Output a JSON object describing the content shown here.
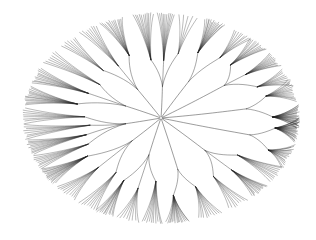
{
  "figure": {
    "kind": "radial-dendrogram",
    "title": "Radial phylogenetic tree",
    "width": 316,
    "height": 240,
    "background_color": "#ffffff"
  },
  "canvas": {
    "center_x": 161,
    "center_y": 118,
    "radius_x": 139,
    "radius_y": 106
  },
  "style": {
    "line_color": "#222222",
    "trunk_color": "#303030",
    "leaf_stroke_width": 0.34,
    "mid_stroke_width": 0.42,
    "trunk_stroke_width": 0.5,
    "leaf_opacity": 0.92,
    "trunk_opacity": 0.95
  },
  "tree": {
    "leaf_count": 384,
    "primary_branch_count": 12,
    "max_depth": 4,
    "root_label": "root",
    "angle_start_deg": -90,
    "angle_sweep_deg": 360,
    "curve_tension": 0.55,
    "seed": 20240517,
    "primary_branches": [
      {
        "label": "clade-A",
        "angle_deg": -88,
        "span_deg": 26,
        "stem_frac": 0.3,
        "leaves": 26,
        "subclades": 3,
        "spread": 0.88,
        "skew": 0.1
      },
      {
        "label": "clade-B",
        "angle_deg": -60,
        "span_deg": 24,
        "stem_frac": 0.4,
        "leaves": 24,
        "subclades": 2,
        "spread": 0.82,
        "skew": -0.12
      },
      {
        "label": "clade-C",
        "angle_deg": -34,
        "span_deg": 28,
        "stem_frac": 0.55,
        "leaves": 34,
        "subclades": 3,
        "spread": 0.95,
        "skew": 0.18
      },
      {
        "label": "clade-D",
        "angle_deg": -8,
        "span_deg": 24,
        "stem_frac": 0.62,
        "leaves": 38,
        "subclades": 2,
        "spread": 0.98,
        "skew": 0.22
      },
      {
        "label": "clade-E",
        "angle_deg": 14,
        "span_deg": 26,
        "stem_frac": 0.66,
        "leaves": 44,
        "subclades": 2,
        "spread": 1.0,
        "skew": 0.14
      },
      {
        "label": "clade-F",
        "angle_deg": 44,
        "span_deg": 30,
        "stem_frac": 0.44,
        "leaves": 32,
        "subclades": 3,
        "spread": 0.9,
        "skew": -0.16
      },
      {
        "label": "clade-G",
        "angle_deg": 76,
        "span_deg": 26,
        "stem_frac": 0.5,
        "leaves": 26,
        "subclades": 2,
        "spread": 0.86,
        "skew": -0.08
      },
      {
        "label": "clade-H",
        "angle_deg": 104,
        "span_deg": 28,
        "stem_frac": 0.36,
        "leaves": 30,
        "subclades": 3,
        "spread": 0.9,
        "skew": 0.12
      },
      {
        "label": "clade-I",
        "angle_deg": 134,
        "span_deg": 30,
        "stem_frac": 0.3,
        "leaves": 34,
        "subclades": 3,
        "spread": 0.93,
        "skew": -0.18
      },
      {
        "label": "clade-J",
        "angle_deg": 168,
        "span_deg": 32,
        "stem_frac": 0.26,
        "leaves": 36,
        "subclades": 4,
        "spread": 0.95,
        "skew": -0.1
      },
      {
        "label": "clade-K",
        "angle_deg": 204,
        "span_deg": 30,
        "stem_frac": 0.28,
        "leaves": 32,
        "subclades": 3,
        "spread": 0.92,
        "skew": 0.16
      },
      {
        "label": "clade-L",
        "angle_deg": 238,
        "span_deg": 30,
        "stem_frac": 0.32,
        "leaves": 28,
        "subclades": 3,
        "spread": 0.88,
        "skew": 0.08
      }
    ]
  },
  "labels": {
    "figure_caption": "",
    "axis_note": ""
  }
}
